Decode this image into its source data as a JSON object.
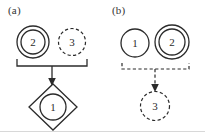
{
  "figure": {
    "background_color": "#ffffff",
    "stroke_color": "#2b2b2b",
    "panels": [
      {
        "id": "a",
        "label": "(a)",
        "nodes": [
          {
            "id": "a-node-2",
            "text": "2",
            "shape": "double-circle",
            "border": "solid",
            "cx": 33,
            "cy": 42,
            "r_outer": 16,
            "r_inner": 12
          },
          {
            "id": "a-node-3",
            "text": "3",
            "shape": "circle",
            "border": "dashed",
            "cx": 72,
            "cy": 42,
            "r_outer": 13.5,
            "r_inner": 0
          },
          {
            "id": "a-node-1",
            "text": "1",
            "shape": "diamond-circle",
            "border": "solid",
            "cx": 53,
            "cy": 107,
            "r_outer": 24,
            "r_inner": 13
          }
        ],
        "connector": {
          "type": "bracket-arrow",
          "style": "solid",
          "bracket_left_x": 17,
          "bracket_right_x": 87,
          "bracket_y": 66,
          "bracket_tick_height": 7,
          "arrow_x": 52,
          "arrow_from_y": 66,
          "arrow_to_y": 85
        }
      },
      {
        "id": "b",
        "label": "(b)",
        "nodes": [
          {
            "id": "b-node-1",
            "text": "1",
            "shape": "circle",
            "border": "solid",
            "cx": 135,
            "cy": 43,
            "r_outer": 14,
            "r_inner": 0
          },
          {
            "id": "b-node-2",
            "text": "2",
            "shape": "double-circle",
            "border": "solid",
            "cx": 172,
            "cy": 42,
            "r_outer": 17,
            "r_inner": 13
          },
          {
            "id": "b-node-3",
            "text": "3",
            "shape": "circle",
            "border": "dashed",
            "cx": 155,
            "cy": 106,
            "r_outer": 14.5,
            "r_inner": 0
          }
        ],
        "connector": {
          "type": "bracket-arrow",
          "style": "dashed",
          "bracket_left_x": 122,
          "bracket_right_x": 189,
          "bracket_y": 69,
          "bracket_tick_height": 6,
          "arrow_x": 155,
          "arrow_from_y": 69,
          "arrow_to_y": 91
        }
      }
    ]
  }
}
